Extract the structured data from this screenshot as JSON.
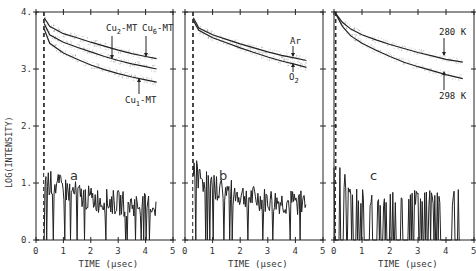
{
  "chart_data": [
    {
      "type": "line",
      "panel": "a",
      "title": "",
      "xlabel": "TIME (μsec)",
      "ylabel": "LOG(INTENSITY)",
      "xlim": [
        0,
        5
      ],
      "ylim": [
        0,
        4
      ],
      "xticks": [
        "0",
        "1",
        "2",
        "3",
        "4",
        "5"
      ],
      "yticks": [
        "0.",
        "1.",
        "2.",
        "3.",
        "4."
      ],
      "grid": false,
      "series": [
        {
          "name": "Cu6-MT",
          "x": [
            0.3,
            0.5,
            1,
            1.5,
            2,
            2.5,
            3,
            3.5,
            4,
            4.4
          ],
          "values": [
            3.9,
            3.75,
            3.62,
            3.55,
            3.47,
            3.4,
            3.33,
            3.27,
            3.22,
            3.18
          ]
        },
        {
          "name": "Cu2-MT",
          "x": [
            0.3,
            0.5,
            1,
            1.5,
            2,
            2.5,
            3,
            3.5,
            4,
            4.4
          ],
          "values": [
            3.8,
            3.6,
            3.47,
            3.38,
            3.3,
            3.22,
            3.15,
            3.09,
            3.04,
            3.0
          ]
        },
        {
          "name": "Cu1-MT",
          "x": [
            0.3,
            0.5,
            1,
            1.5,
            2,
            2.5,
            3,
            3.5,
            4,
            4.4
          ],
          "values": [
            3.7,
            3.45,
            3.28,
            3.17,
            3.07,
            2.99,
            2.92,
            2.86,
            2.81,
            2.77
          ]
        },
        {
          "name": "background",
          "x": [
            0.3,
            0.5,
            1,
            1.5,
            2,
            2.5,
            3,
            3.5,
            4,
            4.4
          ],
          "values": [
            1.1,
            1.0,
            0.9,
            0.8,
            0.72,
            0.68,
            0.65,
            0.62,
            0.6,
            0.6
          ]
        }
      ],
      "annotations": [
        {
          "text": "Cu",
          "sub": "2",
          "suffix": "-MT",
          "target": "Cu2-MT"
        },
        {
          "text": "Cu",
          "sub": "6",
          "suffix": "-MT",
          "target": "Cu6-MT"
        },
        {
          "text": "Cu",
          "sub": "1",
          "suffix": "-MT",
          "target": "Cu1-MT"
        }
      ],
      "label": "a"
    },
    {
      "type": "line",
      "panel": "b",
      "title": "",
      "xlabel": "TIME (μsec)",
      "ylabel": "",
      "xlim": [
        0,
        5
      ],
      "ylim": [
        0,
        4
      ],
      "xticks": [
        "0",
        "1",
        "2",
        "3",
        "4",
        "5"
      ],
      "grid": false,
      "series": [
        {
          "name": "Ar",
          "x": [
            0.3,
            0.5,
            1,
            1.5,
            2,
            2.5,
            3,
            3.5,
            4,
            4.4
          ],
          "values": [
            3.9,
            3.72,
            3.6,
            3.52,
            3.44,
            3.37,
            3.3,
            3.24,
            3.19,
            3.15
          ]
        },
        {
          "name": "O2",
          "x": [
            0.3,
            0.5,
            1,
            1.5,
            2,
            2.5,
            3,
            3.5,
            4,
            4.4
          ],
          "values": [
            3.85,
            3.68,
            3.55,
            3.46,
            3.37,
            3.29,
            3.21,
            3.14,
            3.08,
            3.03
          ]
        },
        {
          "name": "background",
          "x": [
            0.3,
            0.5,
            1,
            1.5,
            2,
            2.5,
            3,
            3.5,
            4,
            4.4
          ],
          "values": [
            1.3,
            1.1,
            0.95,
            0.85,
            0.78,
            0.72,
            0.68,
            0.65,
            0.65,
            0.68
          ]
        }
      ],
      "annotations": [
        {
          "text": "Ar",
          "target": "Ar"
        },
        {
          "text": "O",
          "sub": "2",
          "target": "O2"
        }
      ],
      "label": "b"
    },
    {
      "type": "line",
      "panel": "c",
      "title": "",
      "xlabel": "TIME (μsec)",
      "ylabel": "",
      "xlim": [
        0,
        5
      ],
      "ylim": [
        0,
        4
      ],
      "xticks": [
        "0",
        "1",
        "2",
        "3",
        "4",
        "5"
      ],
      "grid": false,
      "series": [
        {
          "name": "280 K",
          "x": [
            0.05,
            0.3,
            0.6,
            1,
            1.5,
            2,
            2.5,
            3,
            3.5,
            4,
            4.6
          ],
          "values": [
            3.98,
            3.82,
            3.7,
            3.6,
            3.51,
            3.43,
            3.36,
            3.29,
            3.23,
            3.17,
            3.12
          ]
        },
        {
          "name": "298 K",
          "x": [
            0.05,
            0.3,
            0.6,
            1,
            1.5,
            2,
            2.5,
            3,
            3.5,
            4,
            4.6
          ],
          "values": [
            3.98,
            3.75,
            3.58,
            3.45,
            3.33,
            3.22,
            3.12,
            3.04,
            2.97,
            2.9,
            2.83
          ]
        },
        {
          "name": "background",
          "x": [
            0,
            0.2,
            0.4,
            0.6,
            0.8,
            1,
            1.5,
            2,
            2.5,
            3,
            3.5,
            4,
            4.5
          ],
          "values": [
            1.0,
            1.0,
            0.85,
            0.7,
            0.6,
            0.6,
            0.6,
            0.6,
            0.6,
            0.6,
            0.6,
            0.6,
            0.6
          ]
        }
      ],
      "annotations": [
        {
          "text": "280 K",
          "target": "280 K"
        },
        {
          "text": "298 K",
          "target": "298 K"
        }
      ],
      "label": "c"
    }
  ],
  "figure": {
    "ylabel": "LOG(INTENSITY)",
    "panels": [
      {
        "letter": "a",
        "xlabel_text": "TIME",
        "xlabel_unit": "(μsec)"
      },
      {
        "letter": "b",
        "xlabel_text": "TIME",
        "xlabel_unit": "(μsec)"
      },
      {
        "letter": "c",
        "xlabel_text": "TIME",
        "xlabel_unit": "(μsec)"
      }
    ],
    "yticks": [
      "0.",
      "1.",
      "2.",
      "3.",
      "4."
    ],
    "xticks": [
      "0",
      "1",
      "2",
      "3",
      "4",
      "5"
    ],
    "annotations": {
      "a": {
        "cu2": "Cu",
        "cu2_sub": "2",
        "cu6": "Cu",
        "cu6_sub": "6",
        "cu1": "Cu",
        "cu1_sub": "1",
        "suffix": "-MT"
      },
      "b": {
        "ar": "Ar",
        "o2": "O",
        "o2_sub": "2"
      },
      "c": {
        "k280": "280 K",
        "k298": "298 K"
      }
    }
  }
}
